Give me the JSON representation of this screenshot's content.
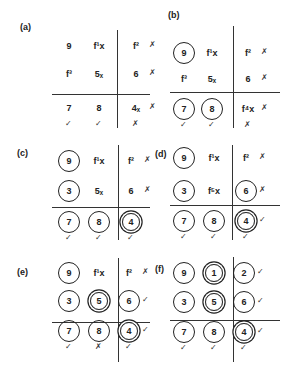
{
  "figure": {
    "panels": [
      {
        "label": "(a)",
        "cells": [
          {
            "t": "9",
            "c": 0,
            "side": "",
            "below": ""
          },
          {
            "t": "f¹x",
            "c": 0,
            "side": "",
            "below": ""
          },
          {
            "t": "f²",
            "c": 0,
            "side": "cross",
            "below": ""
          },
          {
            "t": "f³",
            "c": 0,
            "side": "",
            "below": ""
          },
          {
            "t": "5ₓ",
            "c": 0,
            "side": "",
            "below": ""
          },
          {
            "t": "6",
            "c": 0,
            "side": "cross",
            "below": ""
          },
          {
            "t": "7",
            "c": 0,
            "side": "",
            "below": "check"
          },
          {
            "t": "8",
            "c": 0,
            "side": "",
            "below": "check"
          },
          {
            "t": "4ₓ",
            "c": 0,
            "side": "cross",
            "below": "cross"
          }
        ]
      },
      {
        "label": "(b)",
        "cells": [
          {
            "t": "9",
            "c": 1,
            "side": "",
            "below": ""
          },
          {
            "t": "f¹x",
            "c": 0,
            "side": "",
            "below": ""
          },
          {
            "t": "f²",
            "c": 0,
            "side": "cross",
            "below": ""
          },
          {
            "t": "f³",
            "c": 0,
            "side": "",
            "below": ""
          },
          {
            "t": "5ₓ",
            "c": 0,
            "side": "",
            "below": ""
          },
          {
            "t": "6",
            "c": 0,
            "side": "cross",
            "below": ""
          },
          {
            "t": "7",
            "c": 1,
            "side": "",
            "below": "check"
          },
          {
            "t": "8",
            "c": 1,
            "side": "",
            "below": "check"
          },
          {
            "t": "f⁴x",
            "c": 0,
            "side": "cross",
            "below": "cross"
          }
        ]
      },
      {
        "label": "(c)",
        "cells": [
          {
            "t": "9",
            "c": 1,
            "side": "",
            "below": ""
          },
          {
            "t": "f¹x",
            "c": 0,
            "side": "",
            "below": ""
          },
          {
            "t": "f²",
            "c": 0,
            "side": "cross",
            "below": ""
          },
          {
            "t": "3",
            "c": 1,
            "side": "",
            "below": ""
          },
          {
            "t": "5ₓ",
            "c": 0,
            "side": "",
            "below": ""
          },
          {
            "t": "6",
            "c": 0,
            "side": "cross",
            "below": ""
          },
          {
            "t": "7",
            "c": 1,
            "side": "",
            "below": "check"
          },
          {
            "t": "8",
            "c": 1,
            "side": "",
            "below": "check"
          },
          {
            "t": "4",
            "c": 2,
            "side": "",
            "below": "check"
          }
        ]
      },
      {
        "label": "(d)",
        "cells": [
          {
            "t": "9",
            "c": 1,
            "side": "",
            "below": ""
          },
          {
            "t": "f¹x",
            "c": 0,
            "side": "",
            "below": ""
          },
          {
            "t": "f²",
            "c": 0,
            "side": "cross",
            "below": ""
          },
          {
            "t": "3",
            "c": 1,
            "side": "",
            "below": ""
          },
          {
            "t": "f⁵x",
            "c": 0,
            "side": "",
            "below": ""
          },
          {
            "t": "6",
            "c": 1,
            "side": "cross",
            "below": ""
          },
          {
            "t": "7",
            "c": 1,
            "side": "",
            "below": "check"
          },
          {
            "t": "8",
            "c": 1,
            "side": "",
            "below": "check"
          },
          {
            "t": "4",
            "c": 2,
            "side": "check",
            "below": "check"
          }
        ]
      },
      {
        "label": "(e)",
        "cells": [
          {
            "t": "9",
            "c": 1,
            "side": "",
            "below": ""
          },
          {
            "t": "f¹x",
            "c": 0,
            "side": "",
            "below": ""
          },
          {
            "t": "f²",
            "c": 0,
            "side": "cross",
            "below": ""
          },
          {
            "t": "3",
            "c": 1,
            "side": "",
            "below": ""
          },
          {
            "t": "5",
            "c": 2,
            "side": "",
            "below": ""
          },
          {
            "t": "6",
            "c": 1,
            "side": "check",
            "below": ""
          },
          {
            "t": "7",
            "c": 1,
            "side": "",
            "below": "check"
          },
          {
            "t": "8",
            "c": 1,
            "side": "",
            "below": "cross"
          },
          {
            "t": "4",
            "c": 2,
            "side": "check",
            "below": "check"
          }
        ]
      },
      {
        "label": "(f)",
        "cells": [
          {
            "t": "9",
            "c": 1,
            "side": "",
            "below": ""
          },
          {
            "t": "1",
            "c": 2,
            "side": "",
            "below": ""
          },
          {
            "t": "2",
            "c": 1,
            "side": "check",
            "below": ""
          },
          {
            "t": "3",
            "c": 1,
            "side": "",
            "below": ""
          },
          {
            "t": "5",
            "c": 2,
            "side": "",
            "below": ""
          },
          {
            "t": "6",
            "c": 1,
            "side": "check",
            "below": ""
          },
          {
            "t": "7",
            "c": 1,
            "side": "",
            "below": "check"
          },
          {
            "t": "8",
            "c": 1,
            "side": "",
            "below": "check"
          },
          {
            "t": "4",
            "c": 2,
            "side": "check",
            "below": "check"
          }
        ]
      }
    ],
    "glyphs": {
      "check": "✓",
      "cross": "✗"
    }
  }
}
